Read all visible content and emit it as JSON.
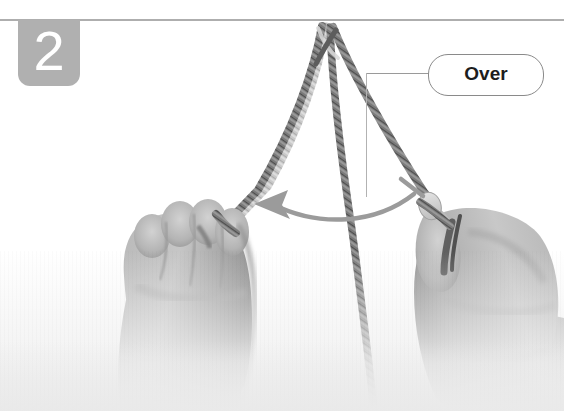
{
  "figure": {
    "step_number": "2",
    "background_color": "#ffffff",
    "rule_color": "#aeaeae",
    "badge_color": "#b0b0b0",
    "badge_text_color": "#ffffff"
  },
  "callout": {
    "label": "Over",
    "border_color": "#8a8a8a",
    "text_color": "#1d1d1d",
    "leader_color": "#9a9a9a"
  },
  "annotation": {
    "arrow_label": "",
    "arrow_direction": "left",
    "arrow_color": "#9b9b9b",
    "tick_color": "#9b9b9b"
  },
  "photo": {
    "description": "Two hands holding a cord forming a loop over a horizontal line",
    "rope_color_dark": "#6f6f6f",
    "rope_color_light": "#cfcfcf",
    "skin_color": "#b8b8b8",
    "skin_shadow": "#8f8f8f",
    "left_hand_label": "left-hand",
    "right_hand_label": "right-hand",
    "strands": [
      {
        "name": "left-strand",
        "label": "strand-to-left-hand"
      },
      {
        "name": "center-strand",
        "label": "strand-center"
      },
      {
        "name": "right-strand",
        "label": "strand-to-right-hand"
      },
      {
        "name": "tail-strand",
        "label": "strand-tail-down"
      }
    ]
  }
}
